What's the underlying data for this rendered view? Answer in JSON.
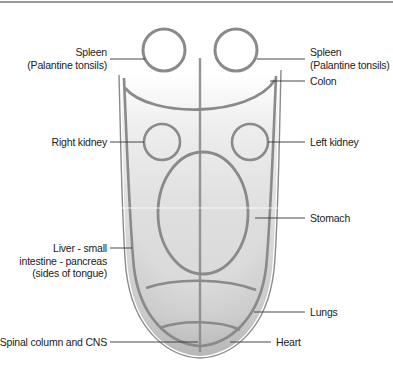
{
  "diagram": {
    "colors": {
      "outline": "#8a8a8a",
      "fill_light": "#f4f4f4",
      "fill_mid": "#dcdcdc",
      "fill_dark": "#c4c4c4",
      "leader_line": "#333333",
      "text": "#222222",
      "top_rule": "#9a9a9a"
    },
    "labels": {
      "spleen_left_line1": "Spleen",
      "spleen_left_line2": "(Palantine tonsils)",
      "spleen_right_line1": "Spleen",
      "spleen_right_line2": "(Palantine tonsils)",
      "colon": "Colon",
      "right_kidney": "Right kidney",
      "left_kidney": "Left kidney",
      "stomach": "Stomach",
      "liver_line1": "Liver - small",
      "liver_line2": "intestine - pancreas",
      "liver_line3": "(sides of tongue)",
      "lungs": "Lungs",
      "spinal": "Spinal column and CNS",
      "heart": "Heart"
    }
  }
}
